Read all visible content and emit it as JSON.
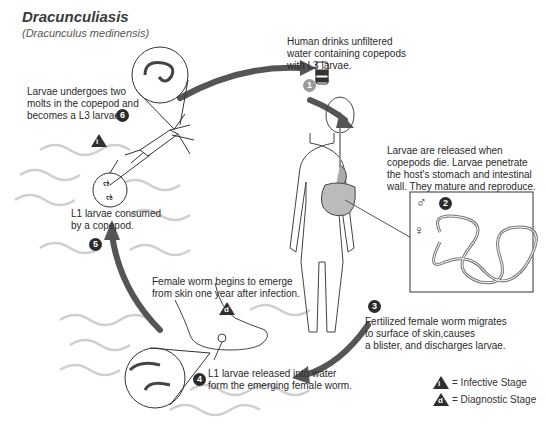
{
  "title": "Dracunculiasis",
  "subtitle": "(Dracunculus medinensis)",
  "steps": [
    {
      "number": "1",
      "text": [
        "Human drinks unfiltered",
        "water containing copepods",
        "with L3 larvae."
      ]
    },
    {
      "number": "2",
      "text": [
        "Larvae are released when",
        "copepods die. Larvae penetrate",
        "the host's stomach and intestinal",
        "wall. They mature and reproduce."
      ]
    },
    {
      "number": "3",
      "text": [
        "Fertilized female worm migrates",
        "to surface of skin,causes",
        "a blister, and discharges larvae."
      ]
    },
    {
      "number": "4",
      "text": [
        "L1 larvae released into water",
        "form the emerging female worm."
      ]
    },
    {
      "number": "5",
      "text": [
        "L1 larvae consumed",
        "by a copepod."
      ]
    },
    {
      "number": "6",
      "text": [
        "Larvae undergoes two",
        "molts in the copepod and",
        "becomes a L3 larvae."
      ]
    }
  ],
  "emergence_note": [
    "Female worm begins to emerge",
    "from skin one year after infection."
  ],
  "stage_markers": {
    "infective": "i",
    "diagnostic": "d"
  },
  "sex_symbols": {
    "male": "♂",
    "female": "♀"
  },
  "legend": [
    {
      "symbol": "i",
      "label": "= Infective Stage"
    },
    {
      "symbol": "d",
      "label": "= Diagnostic Stage"
    }
  ],
  "colors": {
    "arrow": "#555555",
    "wave": "#c8c8c8",
    "badge": "#2b2b2b",
    "badge_light": "#9a9a9a"
  }
}
